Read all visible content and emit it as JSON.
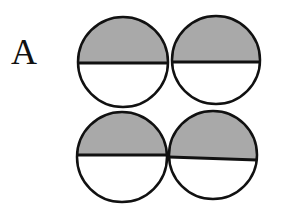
{
  "figure": {
    "panel_label": "A",
    "colors": {
      "fill_top": "#a9a9a9",
      "fill_bottom": "#ffffff",
      "stroke": "#111111"
    },
    "circles": [
      {
        "id": "top-left",
        "cx": 123,
        "cy": 62,
        "r": 45,
        "divider_y1": 63,
        "divider_y2": 63
      },
      {
        "id": "top-right",
        "cx": 216,
        "cy": 60,
        "r": 44,
        "divider_y1": 62,
        "divider_y2": 62
      },
      {
        "id": "bottom-left",
        "cx": 122,
        "cy": 157,
        "r": 45,
        "divider_y1": 155,
        "divider_y2": 155
      },
      {
        "id": "bottom-right",
        "cx": 213,
        "cy": 155,
        "r": 44,
        "divider_y1": 157,
        "divider_y2": 160
      }
    ]
  }
}
